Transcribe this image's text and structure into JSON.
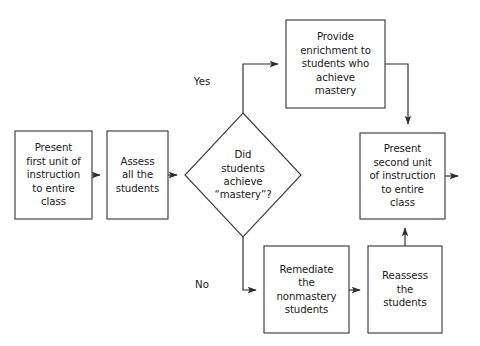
{
  "diagram": {
    "title_bleed": "",
    "colors": {
      "stroke": "#3c3c46",
      "text": "#1a1a1a",
      "background": "#ffffff"
    },
    "nodes": [
      {
        "id": "present-first-unit",
        "shape": "rectangle",
        "label": "Present\nfirst unit of\ninstruction\nto entire\nclass"
      },
      {
        "id": "assess-all-students",
        "shape": "rectangle",
        "label": "Assess\nall the\nstudents"
      },
      {
        "id": "mastery-decision",
        "shape": "diamond",
        "label": "Did\nstudents\nachieve\n“mastery”?"
      },
      {
        "id": "provide-enrichment",
        "shape": "rectangle",
        "label": "Provide\nenrichment to\nstudents who\nachieve\nmastery"
      },
      {
        "id": "present-second-unit",
        "shape": "rectangle",
        "label": "Present\nsecond unit\nof instruction\nto entire\nclass"
      },
      {
        "id": "remediate-nonmastery",
        "shape": "rectangle",
        "label": "Remediate\nthe\nnonmastery\nstudents"
      },
      {
        "id": "reassess-students",
        "shape": "rectangle",
        "label": "Reassess\nthe\nstudents"
      }
    ],
    "edge_labels": [
      {
        "id": "yes-branch-label",
        "label": "Yes"
      },
      {
        "id": "no-branch-label",
        "label": "No"
      }
    ]
  }
}
